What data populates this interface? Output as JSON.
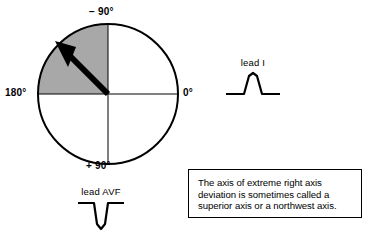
{
  "figure": {
    "type": "hexaxial-reference-circle",
    "background_color": "#ffffff",
    "stroke_color": "#000000",
    "shaded_quadrant_color": "#a8a8a8"
  },
  "circle": {
    "center_x": 108,
    "center_y": 94,
    "radius": 70,
    "angle_labels": {
      "top": "− 90°",
      "left": "180°",
      "right": "0°",
      "bottom": "+ 90°"
    },
    "shaded_region": {
      "name": "extreme-right-axis-deviation-quadrant",
      "from_degrees": -90,
      "to_degrees": 180
    },
    "axis_vector": {
      "name": "mean-qrs-axis-arrow",
      "direction_degrees": -135,
      "description": "thick black arrow pointing to upper left"
    }
  },
  "leads": [
    {
      "id": "lead-I",
      "label": "lead I",
      "deflection": "positive",
      "description": "upright R wave"
    },
    {
      "id": "lead-AVF",
      "label": "lead AVF",
      "deflection": "negative",
      "description": "deep QS complex"
    }
  ],
  "caption": {
    "text": "The axis of extreme right axis deviation is sometimes called a superior axis or a northwest axis."
  }
}
